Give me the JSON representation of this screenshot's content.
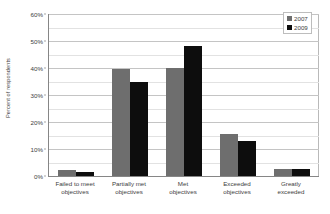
{
  "chart_data": {
    "type": "bar",
    "title": "",
    "subtitle": "",
    "xlabel": "",
    "ylabel": "Percent of respondents",
    "ylim": [
      0,
      60
    ],
    "y_major_step": 10,
    "y_minor_step": 5,
    "grid": true,
    "y_tick_labels": [
      "0%",
      "10%",
      "20%",
      "30%",
      "40%",
      "50%",
      "60%"
    ],
    "y_tick_values": [
      0,
      10,
      20,
      30,
      40,
      50,
      60
    ],
    "legend_position": "top-right",
    "categories": [
      "Failed to meet objectives",
      "Partially met objectives",
      "Met objectives",
      "Exceeded objectives",
      "Greatly exceeded"
    ],
    "category_lines": [
      [
        "Failed to meet",
        "objectives"
      ],
      [
        "Partially met",
        "objectives"
      ],
      [
        "Met",
        "objectives"
      ],
      [
        "Exceeded",
        "objectives"
      ],
      [
        "Greatly",
        "exceeded"
      ]
    ],
    "series": [
      {
        "name": "2007",
        "color": "#6e6e6e",
        "values": [
          2.1,
          39.8,
          40.1,
          15.4,
          2.7
        ]
      },
      {
        "name": "2009",
        "color": "#0d0d0d",
        "values": [
          1.6,
          34.8,
          48.3,
          12.8,
          2.5
        ]
      }
    ]
  },
  "legend": {
    "items": [
      {
        "label": "2007",
        "color": "#6e6e6e"
      },
      {
        "label": "2009",
        "color": "#0d0d0d"
      }
    ]
  },
  "axes": {
    "y_title": "Percent of respondents"
  }
}
